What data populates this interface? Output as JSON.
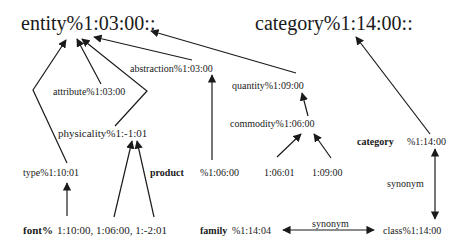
{
  "diagram": {
    "nodes": {
      "entity": "entity%1:03:00::",
      "category_root": "category%1:14:00::",
      "abstraction": "abstraction%1:03:00",
      "attribute": "attribute%1:03:00",
      "quantity": "quantity%1:09:00",
      "physicality": "physicality%1:-1:01",
      "commodity": "commodity%1:06:00",
      "type": "type%1:10:01",
      "product_word": "product",
      "product_sense": "%1:06:00",
      "commodity_sense_a": "1:06:01",
      "commodity_sense_b": "1:09:00",
      "category_word": "category",
      "category_sense": "%1:14:00",
      "font_word": "font%",
      "font_senses": "1:10:00, 1:06:00, 1:-2:01",
      "family_word": "family",
      "family_sense": "%1:14:04",
      "class": "class%1:14:00"
    },
    "edge_labels": {
      "category_class_synonym": "synonym",
      "family_class_synonym": "synonym"
    },
    "edges": [
      {
        "from": "type",
        "to": "entity",
        "kind": "hypernym"
      },
      {
        "from": "attribute",
        "to": "entity",
        "kind": "hypernym"
      },
      {
        "from": "physicality",
        "to": "entity",
        "kind": "hypernym"
      },
      {
        "from": "abstraction",
        "to": "entity",
        "kind": "hypernym"
      },
      {
        "from": "quantity",
        "to": "entity",
        "kind": "hypernym"
      },
      {
        "from": "product",
        "to": "abstraction",
        "kind": "hypernym"
      },
      {
        "from": "commodity",
        "to": "quantity",
        "kind": "hypernym"
      },
      {
        "from": "1:06:01",
        "to": "commodity",
        "kind": "hypernym"
      },
      {
        "from": "1:09:00",
        "to": "commodity",
        "kind": "hypernym"
      },
      {
        "from": "font 1:10:00",
        "to": "type",
        "kind": "hypernym"
      },
      {
        "from": "font 1:06:00",
        "to": "physicality",
        "kind": "hypernym"
      },
      {
        "from": "font 1:-2:01",
        "to": "physicality",
        "kind": "hypernym"
      },
      {
        "from": "category",
        "to": "category_root",
        "kind": "hypernym"
      },
      {
        "from": "category",
        "to": "class",
        "kind": "synonym"
      },
      {
        "from": "family",
        "to": "class",
        "kind": "synonym"
      }
    ],
    "colors": {
      "ink": "#1a1a1a",
      "background": "#ffffff"
    }
  }
}
